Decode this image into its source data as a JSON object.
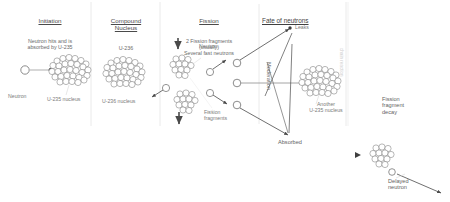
{
  "diagram": {
    "ink_color": "#5a5a5a",
    "divider_color": "#e2e2e2",
    "background": "#ffffff"
  },
  "panels": [
    {
      "id": "initiation",
      "heading": "Initiation",
      "subheading": "Neutron hits and is\nabsorbed by U-235",
      "labels": {
        "neutron": "Neutron",
        "nucleus": "U-235 nucleus"
      }
    },
    {
      "id": "compound-nucleus",
      "heading": "Compound\nNucleus",
      "subheading": "U-236",
      "labels": {
        "nucleus": "U-236 nucleus"
      }
    },
    {
      "id": "fission",
      "heading": "Fission",
      "subheading": "2 Fission fragments\n(usually)\nSeveral fast neutrons",
      "labels": {
        "neutron": "Neutron",
        "fragments": "Fission\nfragments"
      }
    },
    {
      "id": "fate-of-neutrons",
      "heading": "Fate of neutrons",
      "labels": {
        "leaks": "Leaks",
        "moderation": "Moderation",
        "another_nucleus": "Another\nU-235 nucleus",
        "absorbed": "Absorbed"
      }
    },
    {
      "id": "fragment-decay",
      "heading": "Fission\nfragment\ndecay",
      "labels": {
        "delayed_neutron": "Delayed\nneutron",
        "edge_note": "chain reaction"
      }
    }
  ]
}
